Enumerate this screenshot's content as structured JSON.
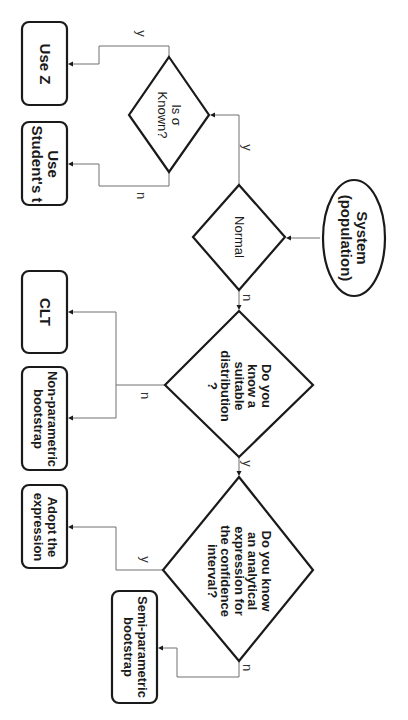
{
  "diagram": {
    "orientation": "rotated-90-clockwise",
    "colors": {
      "stroke": "#1a1a1a",
      "connector": "#707070",
      "background": "#ffffff"
    },
    "nodes": {
      "start": {
        "type": "ellipse",
        "line1": "System",
        "line2": "(population)"
      },
      "normal": {
        "type": "decision",
        "text": "Normal"
      },
      "sigma": {
        "type": "decision",
        "line1": "Is σ",
        "line2": "Known?"
      },
      "use_z": {
        "type": "terminal",
        "text": "Use Z"
      },
      "use_t": {
        "type": "terminal",
        "line1": "Use",
        "line2": "Student's t"
      },
      "suitable": {
        "type": "decision",
        "line1": "Do you",
        "line2": "know a",
        "line3": "suitable",
        "line4": "distribution",
        "line5": "?"
      },
      "clt": {
        "type": "terminal",
        "text": "CLT"
      },
      "nonparam": {
        "type": "terminal",
        "line1": "Non-parametric",
        "line2": "bootstrap"
      },
      "analytical": {
        "type": "decision",
        "line1": "Do you know",
        "line2": "an analytical",
        "line3": "expression for",
        "line4": "the confidence",
        "line5": "interval?"
      },
      "adopt": {
        "type": "terminal",
        "line1": "Adopt the",
        "line2": "expression"
      },
      "semiparam": {
        "type": "terminal",
        "line1": "Semi-parametric",
        "line2": "bootstrap"
      }
    },
    "edges": [
      {
        "from": "start",
        "to": "normal",
        "label": ""
      },
      {
        "from": "normal",
        "to": "sigma",
        "label": "y"
      },
      {
        "from": "normal",
        "to": "suitable",
        "label": "n"
      },
      {
        "from": "sigma",
        "to": "use_z",
        "label": "y"
      },
      {
        "from": "sigma",
        "to": "use_t",
        "label": "n"
      },
      {
        "from": "suitable",
        "to": "clt",
        "label": "n"
      },
      {
        "from": "suitable",
        "to": "nonparam",
        "label": "n"
      },
      {
        "from": "suitable",
        "to": "analytical",
        "label": "y"
      },
      {
        "from": "analytical",
        "to": "adopt",
        "label": "y"
      },
      {
        "from": "analytical",
        "to": "semiparam",
        "label": "n"
      }
    ],
    "edge_labels": {
      "normal_yes": "y",
      "normal_no": "n",
      "sigma_yes": "y",
      "sigma_no": "n",
      "suitable_no": "n",
      "suitable_yes": "y",
      "analytical_yes": "y",
      "analytical_no": "n"
    }
  }
}
